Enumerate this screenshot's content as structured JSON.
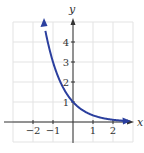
{
  "chart_data": {
    "type": "line",
    "title": "",
    "xlabel": "x",
    "ylabel": "y",
    "function": "y = (1/3)^x",
    "xlim": [
      -3,
      3
    ],
    "ylim": [
      -1,
      5
    ],
    "grid": true,
    "x_ticks": [
      -2,
      -1,
      1,
      2
    ],
    "y_ticks": [
      1,
      2,
      3,
      4
    ],
    "x_tick_labels": [
      "−2",
      "−1",
      "1",
      "2"
    ],
    "y_tick_labels": [
      "1",
      "2",
      "3",
      "4"
    ],
    "series": [
      {
        "name": "curve",
        "color": "#2b3f9e",
        "x": [
          -1.45,
          -1,
          -0.5,
          0,
          0.5,
          1,
          1.5,
          2,
          2.8
        ],
        "y": [
          4.92,
          3.0,
          1.73,
          1.0,
          0.58,
          0.33,
          0.19,
          0.11,
          0.05
        ]
      }
    ],
    "annotations": []
  },
  "colors": {
    "curve": "#2b3f9e",
    "grid": "#e3e3e3",
    "axis": "#333333"
  }
}
